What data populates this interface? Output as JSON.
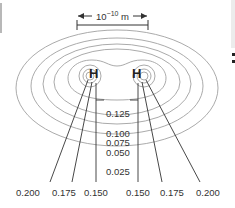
{
  "diagram": {
    "scale_bar": {
      "label_base": "10",
      "label_exp": "−10",
      "label_unit": " m"
    },
    "atoms": [
      {
        "symbol": "H",
        "x": 95,
        "y": 73
      },
      {
        "symbol": "H",
        "x": 138,
        "y": 73
      }
    ],
    "center_labels": [
      "0.125",
      "0.100",
      "0.075",
      "0.050",
      "0.025"
    ],
    "bottom_labels": [
      "0.200",
      "0.175",
      "0.150",
      "0.150",
      "0.175",
      "0.200"
    ],
    "line_color": "#9a9a9a",
    "leader_color": "#333333"
  }
}
